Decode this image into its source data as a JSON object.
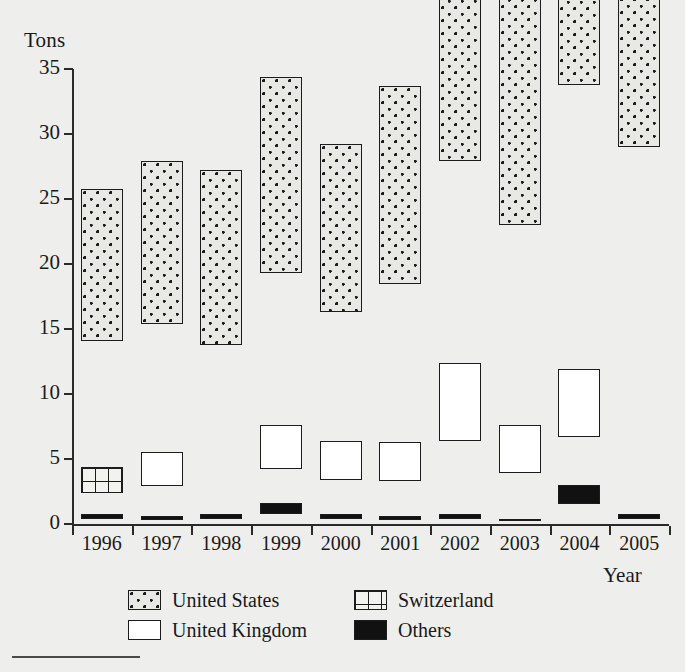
{
  "chart_data": {
    "type": "bar",
    "subtype": "stacked-bar",
    "title": "",
    "xlabel": "Year",
    "ylabel": "Tons",
    "categories": [
      "1996",
      "1997",
      "1998",
      "1999",
      "2000",
      "2001",
      "2002",
      "2003",
      "2004",
      "2005"
    ],
    "ylim": [
      0,
      35
    ],
    "yticks": [
      0,
      5,
      10,
      15,
      20,
      25,
      30,
      35
    ],
    "ytick_labels": [
      "0",
      "5",
      "10",
      "15",
      "20",
      "25",
      "30",
      "35"
    ],
    "grid": false,
    "legend_position": "bottom",
    "series": [
      {
        "name": "United States",
        "pattern": "dotted",
        "color": "#e8e8e4",
        "values": [
          11.7,
          12.5,
          13.4,
          15.1,
          12.9,
          15.2,
          21.1,
          19.1,
          27.1,
          28.6
        ]
      },
      {
        "name": "Switzerland",
        "pattern": "grid",
        "color": "#f2f2ef",
        "values": [
          2.0,
          0.0,
          0.0,
          0.0,
          0.0,
          0.0,
          0.4,
          0.0,
          0.0,
          0.0
        ]
      },
      {
        "name": "United Kingdom",
        "pattern": "solid-white",
        "color": "#ffffff",
        "values": [
          0.0,
          2.6,
          0.0,
          3.4,
          3.0,
          3.0,
          6.0,
          3.7,
          5.2,
          0.0
        ]
      },
      {
        "name": "Others",
        "pattern": "solid-black",
        "color": "#111111",
        "values": [
          0.4,
          0.3,
          0.4,
          0.8,
          0.4,
          0.3,
          0.4,
          0.2,
          1.5,
          0.4
        ]
      }
    ],
    "totals": [
      14.1,
      15.4,
      13.8,
      19.3,
      16.3,
      18.5,
      27.9,
      23.0,
      33.8,
      29.0
    ]
  },
  "axes": {
    "y_title": "Tons",
    "x_title": "Year"
  },
  "legend": {
    "items": [
      {
        "label": "United States",
        "swatch": "dotted-swatch"
      },
      {
        "label": "Switzerland",
        "swatch": "grid-swatch"
      },
      {
        "label": "United Kingdom",
        "swatch": "white-swatch"
      },
      {
        "label": "Others",
        "swatch": "black-swatch"
      }
    ]
  }
}
